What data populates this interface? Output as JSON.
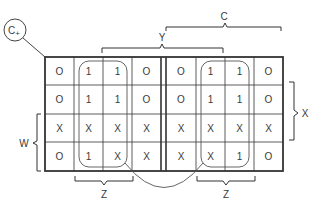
{
  "diagram": {
    "type": "karnaugh-map",
    "corner_label": "C+",
    "variable_labels": {
      "c": "C",
      "y": "Y",
      "x": "X",
      "w": "W",
      "z_left": "Z",
      "z_right": "Z"
    },
    "left_map": {
      "rows": [
        [
          "0",
          "1",
          "1",
          "0"
        ],
        [
          "0",
          "1",
          "1",
          "0"
        ],
        [
          "X",
          "X",
          "X",
          "X"
        ],
        [
          "0",
          "1",
          "X",
          "X"
        ]
      ]
    },
    "right_map": {
      "rows": [
        [
          "0",
          "1",
          "1",
          "0"
        ],
        [
          "0",
          "1",
          "1",
          "0"
        ],
        [
          "X",
          "X",
          "X",
          "X"
        ],
        [
          "X",
          "X",
          "1",
          "0"
        ]
      ]
    },
    "groupings": [
      "left map: columns 2-3, all rows (rounded loop)",
      "right map: columns 2-3, all rows (rounded loop)",
      "arc connecting both loops below the maps"
    ]
  }
}
